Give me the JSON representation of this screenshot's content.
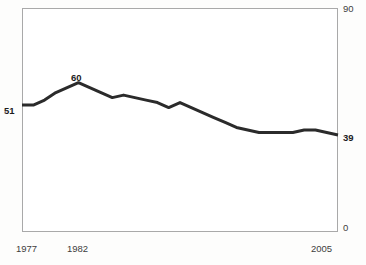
{
  "chart_data": {
    "type": "line",
    "title": "",
    "subtitle": "",
    "xlabel": "",
    "ylabel": "",
    "xlim": [
      1977,
      2005
    ],
    "ylim": [
      0,
      90
    ],
    "grid": false,
    "legend": null,
    "y_axis_ticks": [
      "0",
      "90"
    ],
    "x_axis_ticks": [
      "1977",
      "1982",
      "2005"
    ],
    "annotations": [
      {
        "name": "start-value",
        "text": "51",
        "x": 1977,
        "y": 51
      },
      {
        "name": "peak-value",
        "text": "60",
        "x": 1982,
        "y": 60
      },
      {
        "name": "end-value",
        "text": "39",
        "x": 2005,
        "y": 39
      }
    ],
    "x": [
      1977,
      1978,
      1979,
      1980,
      1981,
      1982,
      1983,
      1984,
      1985,
      1986,
      1987,
      1988,
      1989,
      1990,
      1991,
      1992,
      1993,
      1994,
      1995,
      1996,
      1997,
      1998,
      1999,
      2000,
      2001,
      2002,
      2003,
      2004,
      2005
    ],
    "series": [
      {
        "name": "value",
        "values": [
          51,
          51,
          53,
          56,
          58,
          60,
          58,
          56,
          54,
          55,
          54,
          53,
          52,
          50,
          52,
          50,
          48,
          46,
          44,
          42,
          41,
          40,
          40,
          40,
          40,
          41,
          41,
          40,
          39
        ]
      }
    ],
    "style": {
      "line_color": "#2b2b2b",
      "line_width_px": 3,
      "plot_border_color": "#a9a9a9",
      "plot_background": "#ffffff",
      "page_background": "#fdfdfc",
      "label_color": "#3d3d3d",
      "value_label_color": "#1c1c1c"
    }
  },
  "axis": {
    "y_max": "90",
    "y_min": "0",
    "x_first": "1977",
    "x_mid": "1982",
    "x_last": "2005"
  },
  "labels": {
    "start_value": "51",
    "peak_value": "60",
    "end_value": "39"
  }
}
